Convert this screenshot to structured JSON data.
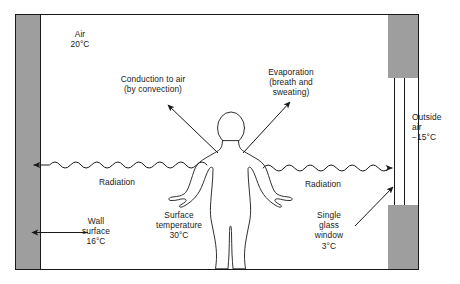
{
  "diagram": {
    "type": "thermal-comfort-schematic",
    "frame": {
      "wall_fill": "#9e9e9e",
      "line_color": "#1a1a1a",
      "background": "#ffffff"
    },
    "labels": {
      "air": "Air\n20°C",
      "conduction": "Conduction to air\n(by convection)",
      "evaporation": "Evaporation\n(breath and\nsweating)",
      "outside_air": "Outside\nair\n−15°C",
      "radiation_left": "Radiation",
      "radiation_right": "Radiation",
      "wall_surface": "Wall\nsurface\n16°C",
      "surface_temperature": "Surface\ntemperature\n30°C",
      "window": "Single\nglass\nwindow\n3°C"
    },
    "temperatures": {
      "indoor_air": "20°C",
      "outdoor_air": "−15°C",
      "wall_surface": "16°C",
      "body_surface": "30°C",
      "window_glass": "3°C"
    },
    "heat_paths": [
      {
        "name": "conduction-to-air",
        "mode": "convection",
        "arrow": "straight-up-left"
      },
      {
        "name": "evaporation",
        "mode": "breath-and-sweating",
        "arrow": "straight-up-right"
      },
      {
        "name": "radiation-to-wall",
        "mode": "radiation",
        "arrow": "wavy-left"
      },
      {
        "name": "radiation-to-window",
        "mode": "radiation",
        "arrow": "wavy-right"
      }
    ]
  }
}
